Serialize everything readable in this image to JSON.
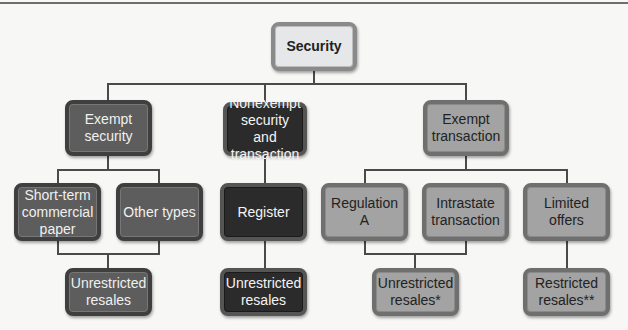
{
  "diagram": {
    "root": {
      "label": "Security"
    },
    "level1": [
      {
        "label": "Exempt security"
      },
      {
        "label": "Nonexempt security and transaction"
      },
      {
        "label": "Exempt transaction"
      }
    ],
    "level2": [
      {
        "label": "Short-term commercial paper",
        "parent": "Exempt security"
      },
      {
        "label": "Other types",
        "parent": "Exempt security"
      },
      {
        "label": "Register",
        "parent": "Nonexempt security and transaction"
      },
      {
        "label": "Regulation A",
        "parent": "Exempt transaction"
      },
      {
        "label": "Intrastate transaction",
        "parent": "Exempt transaction"
      },
      {
        "label": "Limited offers",
        "parent": "Exempt transaction"
      }
    ],
    "level3": [
      {
        "label": "Unrestricted resales",
        "parents": [
          "Short-term commercial paper",
          "Other types"
        ]
      },
      {
        "label": "Unrestricted resales",
        "parents": [
          "Register"
        ]
      },
      {
        "label": "Unrestricted resales*",
        "parents": [
          "Regulation A",
          "Intrastate transaction"
        ]
      },
      {
        "label": "Restricted resales**",
        "parents": [
          "Limited offers"
        ]
      }
    ]
  }
}
